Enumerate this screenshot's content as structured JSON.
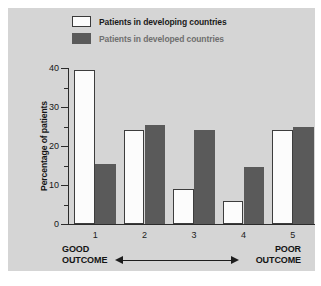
{
  "chart_data": {
    "type": "bar",
    "title": "",
    "xlabel": "",
    "ylabel": "Percentage of patients",
    "categories": [
      "1",
      "2",
      "3",
      "4",
      "5"
    ],
    "ylim": [
      0,
      40
    ],
    "yticks": [
      0,
      10,
      20,
      30,
      40
    ],
    "ytick_labels": [
      "0",
      "10",
      "20",
      "30",
      "40"
    ],
    "yminor_ticks": [
      5,
      15,
      25,
      35
    ],
    "grid": false,
    "legend_position": "top-center",
    "series": [
      {
        "name": "Patients in developing countries",
        "color": "#fcfcfc",
        "edge_color": "#3d3d3d",
        "values": [
          39.5,
          24,
          9,
          6,
          24
        ]
      },
      {
        "name": "Patients in developed countries",
        "color": "#5a5a5a",
        "edge_color": "#5a5a5a",
        "values": [
          15.5,
          25.5,
          24,
          14.5,
          25
        ]
      }
    ],
    "annotations": {
      "left_label_line1": "GOOD",
      "left_label_line2": "OUTCOME",
      "right_label_line1": "POOR",
      "right_label_line2": "OUTCOME",
      "arrow": "double-headed"
    }
  },
  "legend": {
    "items": [
      {
        "label": "Patients in developing countries",
        "swatch": "white-square-outlined"
      },
      {
        "label": "Patients in developed countries",
        "swatch": "dark-gray-square"
      }
    ]
  },
  "colors": {
    "panel_background": "#d5d5d5",
    "page_background": "#ffffff",
    "axis": "#2b2b2b",
    "bar_developing": "#fcfcfc",
    "bar_developed": "#5a5a5a",
    "text": "#171717",
    "legend_faded_text": "#6f6f6f"
  }
}
